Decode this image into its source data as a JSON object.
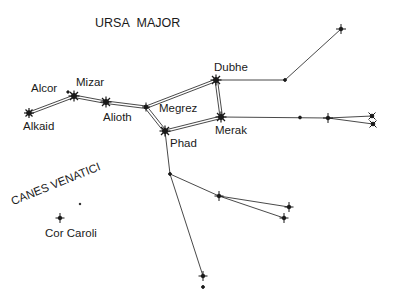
{
  "title": "URSA MAJOR",
  "constellation2": "CANES VENATICI",
  "colors": {
    "ink": "#1a1a1a",
    "background": "#ffffff"
  },
  "stars": [
    {
      "name": "Alkaid",
      "x": 29,
      "y": 113,
      "type": "bright"
    },
    {
      "name": "Mizar",
      "x": 74,
      "y": 96,
      "type": "bright"
    },
    {
      "name": "Alcor",
      "x": 68,
      "y": 92,
      "type": "dot"
    },
    {
      "name": "Alioth",
      "x": 106,
      "y": 102,
      "type": "bright"
    },
    {
      "name": "Megrez",
      "x": 146,
      "y": 107,
      "type": "medium"
    },
    {
      "name": "Phad",
      "x": 165,
      "y": 131,
      "type": "bright"
    },
    {
      "name": "Dubhe",
      "x": 216,
      "y": 80,
      "type": "bright"
    },
    {
      "name": "Merak",
      "x": 221,
      "y": 117,
      "type": "bright"
    },
    {
      "name": "Cor Caroli",
      "x": 60,
      "y": 218,
      "type": "medium"
    }
  ],
  "labels": {
    "alcor": "Alcor",
    "mizar": "Mizar",
    "alkaid": "Alkaid",
    "alioth": "Alioth",
    "megrez": "Megrez",
    "phad": "Phad",
    "dubhe": "Dubhe",
    "merak": "Merak",
    "cor_caroli": "Cor Caroli"
  }
}
